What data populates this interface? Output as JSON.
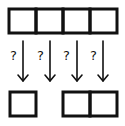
{
  "diagram": {
    "top_row": {
      "cells": 4
    },
    "bottom_row": {
      "groups": [
        {
          "cells": 1
        },
        {
          "cells": 2
        }
      ]
    },
    "arrows": [
      {
        "label": "?"
      },
      {
        "label": "?"
      },
      {
        "label": "?"
      },
      {
        "label": "?"
      }
    ],
    "colors": {
      "stroke": "#111111",
      "background": "#ffffff"
    }
  }
}
